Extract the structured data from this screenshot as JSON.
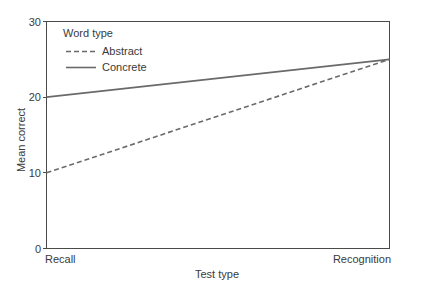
{
  "chart_data": {
    "type": "line",
    "title": "",
    "xlabel": "Test type",
    "ylabel": "Mean correct",
    "categories": [
      "Recall",
      "Recognition"
    ],
    "x": [
      0,
      1
    ],
    "xlim": [
      0,
      1
    ],
    "ylim": [
      0,
      30
    ],
    "yticks": [
      0,
      10,
      20,
      30
    ],
    "ytick_labels": [
      "0",
      "10",
      "20",
      "30"
    ],
    "grid": false,
    "legend": {
      "title": "Word type",
      "position": "top-left-inside",
      "entries": [
        {
          "name": "Abstract",
          "style": "dashed",
          "color": "#6a6a6a"
        },
        {
          "name": "Concrete",
          "style": "solid",
          "color": "#6a6a6a"
        }
      ]
    },
    "series": [
      {
        "name": "Abstract",
        "style": "dashed",
        "color": "#6a6a6a",
        "values": [
          10,
          25
        ]
      },
      {
        "name": "Concrete",
        "style": "solid",
        "color": "#6a6a6a",
        "values": [
          20,
          25
        ]
      }
    ],
    "annotations": []
  },
  "axes": {
    "y_title": "Mean correct",
    "x_title": "Test type",
    "y_tick_0": "0",
    "y_tick_10": "10",
    "y_tick_20": "20",
    "y_tick_30": "30",
    "x_cat_left": "Recall",
    "x_cat_right": "Recognition"
  },
  "legend": {
    "title": "Word type",
    "item_abstract": "Abstract",
    "item_concrete": "Concrete"
  },
  "colors": {
    "line": "#6a6a6a",
    "axis": "#4a4a4a",
    "text": "#3a3a3a",
    "background": "#ffffff"
  }
}
